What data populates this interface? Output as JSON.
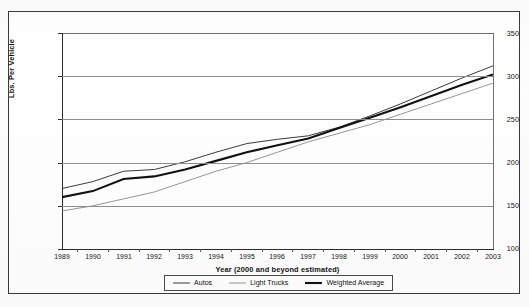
{
  "chart_data": {
    "type": "line",
    "title": "",
    "xlabel": "Year (2000 and beyond estimated)",
    "ylabel": "Lbs. Per Vehicle",
    "categories": [
      "1989",
      "1990",
      "1991",
      "1992",
      "1993",
      "1994",
      "1995",
      "1996",
      "1997",
      "1998",
      "1999",
      "2000",
      "2001",
      "2002",
      "2003"
    ],
    "x": [
      1989,
      1990,
      1991,
      1992,
      1993,
      1994,
      1995,
      1996,
      1997,
      1998,
      1999,
      2000,
      2001,
      2002,
      2003
    ],
    "xlim": [
      1989,
      2003
    ],
    "ylim": [
      100,
      350
    ],
    "yticks": [
      100,
      150,
      200,
      250,
      300,
      350
    ],
    "ytick_labels": [
      "100",
      "150",
      "200",
      "250",
      "300",
      "350"
    ],
    "grid": true,
    "legend_position": "bottom-center",
    "series": [
      {
        "name": "Autos",
        "style": "thin",
        "color": "#3b3b3b",
        "values": [
          170,
          178,
          190,
          192,
          201,
          212,
          222,
          227,
          231,
          241,
          254,
          268,
          283,
          298,
          312
        ]
      },
      {
        "name": "Light Trucks",
        "style": "thin-light",
        "color": "#8a8a8a",
        "values": [
          144,
          150,
          158,
          166,
          178,
          190,
          200,
          212,
          224,
          234,
          244,
          256,
          268,
          280,
          292
        ]
      },
      {
        "name": "Weighted Average",
        "style": "bold",
        "color": "#121212",
        "values": [
          160,
          167,
          181,
          184,
          192,
          202,
          212,
          220,
          228,
          240,
          252,
          264,
          277,
          290,
          302
        ]
      }
    ]
  },
  "legend": {
    "items": [
      {
        "label": "Autos"
      },
      {
        "label": "Light Trucks"
      },
      {
        "label": "Weighted Average"
      }
    ]
  }
}
